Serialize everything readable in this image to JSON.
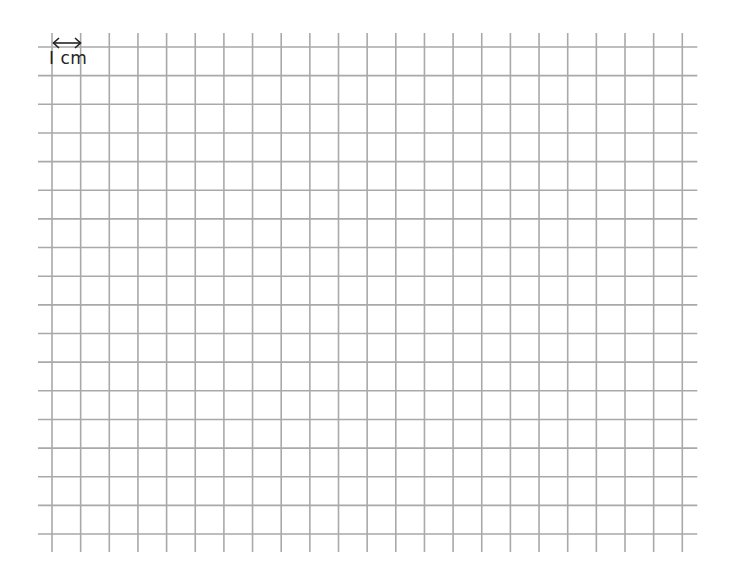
{
  "grid": {
    "columns": 22,
    "rows": 17,
    "cell_size_px": 28.65,
    "origin_x": 52,
    "origin_y": 47,
    "line_extension_px": 14,
    "line_color": "#a9a9a9",
    "line_width": 1.6
  },
  "scale": {
    "label": "I cm",
    "arrow": "double-headed horizontal arrow spanning one cell"
  }
}
